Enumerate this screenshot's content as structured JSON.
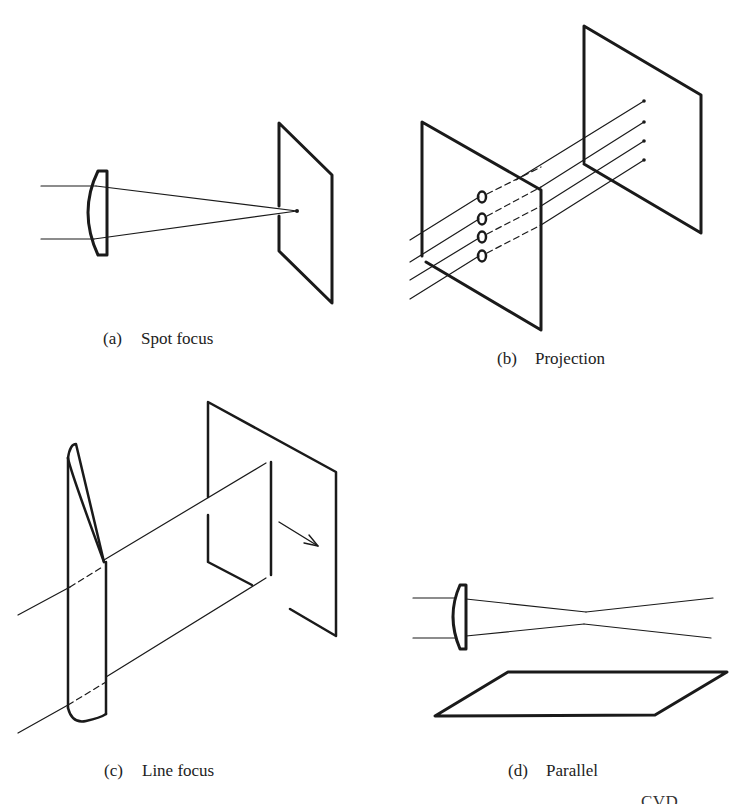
{
  "figure": {
    "panels": [
      {
        "id": "a",
        "tag": "(a)",
        "label": "Spot focus",
        "elements": [
          "plano-convex lens",
          "two converging rays",
          "target plane with focal spot"
        ]
      },
      {
        "id": "b",
        "tag": "(b)",
        "label": "Projection",
        "elements": [
          "mask plane with four apertures",
          "four parallel rays",
          "target plane with four spots"
        ]
      },
      {
        "id": "c",
        "tag": "(c)",
        "label": "Line focus",
        "elements": [
          "cylindrical lens",
          "two rays",
          "target plane with focal line",
          "scan direction arrow"
        ]
      },
      {
        "id": "d",
        "tag": "(d)",
        "label": "Parallel",
        "elements": [
          "plano-convex lens",
          "rays crossing at waist",
          "substrate plane parallel to beam"
        ]
      }
    ],
    "footer_partial_text": "... ... ... ... ... ... ... ... ... CVD ... ... ... ..."
  },
  "colors": {
    "ink": "#1a1a1a",
    "background": "#ffffff"
  }
}
